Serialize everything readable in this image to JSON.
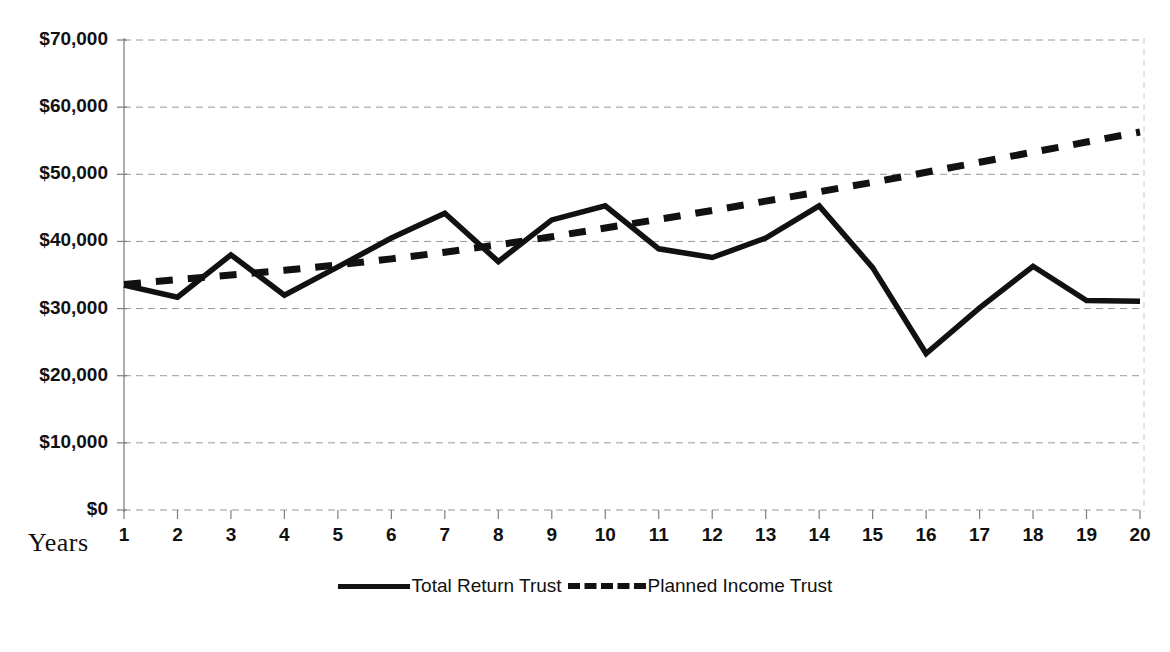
{
  "chart_data": {
    "type": "line",
    "title": "",
    "xlabel": "Years",
    "ylabel": "",
    "x": [
      1,
      2,
      3,
      4,
      5,
      6,
      7,
      8,
      9,
      10,
      11,
      12,
      13,
      14,
      15,
      16,
      17,
      18,
      19,
      20
    ],
    "categories": [
      "1",
      "2",
      "3",
      "4",
      "5",
      "6",
      "7",
      "8",
      "9",
      "10",
      "11",
      "12",
      "13",
      "14",
      "15",
      "16",
      "17",
      "18",
      "19",
      "20"
    ],
    "ylim": [
      0,
      70000
    ],
    "ytick_values": [
      0,
      10000,
      20000,
      30000,
      40000,
      50000,
      60000,
      70000
    ],
    "ytick_labels": [
      "$0",
      "$10,000",
      "$20,000",
      "$30,000",
      "$40,000",
      "$50,000",
      "$60,000",
      "$70,000"
    ],
    "grid": true,
    "grid_axis": "y",
    "legend_position": "bottom",
    "series": [
      {
        "name": "Total Return Trust",
        "style": "solid",
        "color": "#111111",
        "values": [
          33500,
          31700,
          38000,
          32000,
          36200,
          40500,
          44200,
          37000,
          43200,
          45300,
          38900,
          37600,
          40500,
          45300,
          36100,
          23300,
          30100,
          36300,
          31200,
          31100
        ]
      },
      {
        "name": "Planned Income Trust",
        "style": "dashed",
        "color": "#111111",
        "values": [
          33600,
          34300,
          35000,
          35700,
          36500,
          37400,
          38400,
          39500,
          40700,
          42000,
          43300,
          44600,
          46000,
          47400,
          48800,
          50300,
          51800,
          53300,
          54800,
          56300
        ]
      }
    ]
  },
  "axes": {
    "x_axis_label": "Years"
  },
  "legend": {
    "items": [
      {
        "label": "Total Return Trust",
        "style": "solid"
      },
      {
        "label": "Planned Income Trust",
        "style": "dashed"
      }
    ]
  }
}
